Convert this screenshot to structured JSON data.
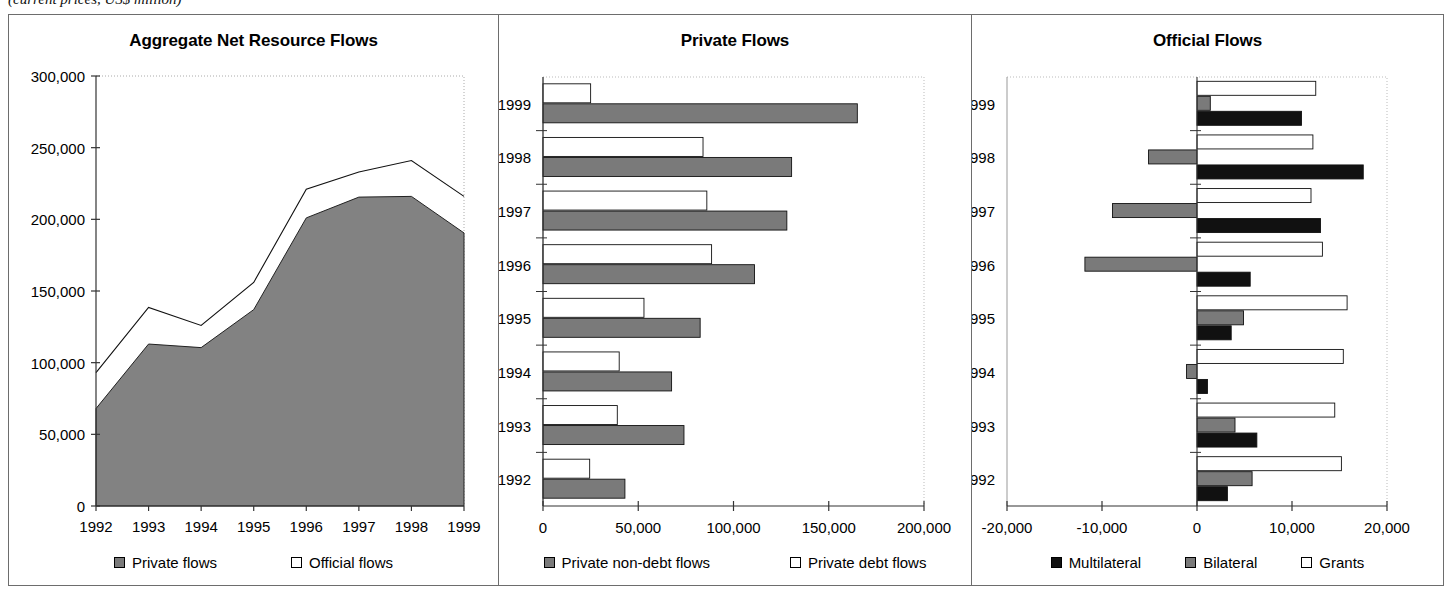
{
  "caption": "(current prices, US$ million)",
  "panels": [
    {
      "title": "Aggregate Net Resource Flows",
      "legend": [
        {
          "label": "Private flows",
          "swatch": "gray"
        },
        {
          "label": "Official flows",
          "swatch": "white"
        }
      ]
    },
    {
      "title": "Private Flows",
      "legend": [
        {
          "label": "Private non-debt flows",
          "swatch": "gray"
        },
        {
          "label": "Private debt flows",
          "swatch": "white"
        }
      ]
    },
    {
      "title": "Official Flows",
      "legend": [
        {
          "label": "Multilateral",
          "swatch": "black"
        },
        {
          "label": "Bilateral",
          "swatch": "gray"
        },
        {
          "label": "Grants",
          "swatch": "white"
        }
      ]
    }
  ],
  "chart_data": [
    {
      "type": "area",
      "title": "Aggregate Net Resource Flows",
      "xlabel": "",
      "ylabel": "",
      "categories": [
        "1992",
        "1993",
        "1994",
        "1995",
        "1996",
        "1997",
        "1998",
        "1999"
      ],
      "xticklabels": [
        "1992",
        "1993",
        "1994",
        "1995",
        "1996",
        "1997",
        "1998",
        "1999"
      ],
      "yticklabels": [
        "0",
        "50,000",
        "100,000",
        "150,000",
        "200,000",
        "250,000",
        "300,000"
      ],
      "ylim": [
        0,
        300000
      ],
      "ytick_step": 50000,
      "grid": false,
      "stacked": true,
      "series": [
        {
          "name": "Private flows",
          "color": "#7a7a7a",
          "values": [
            68000,
            113000,
            110500,
            137000,
            201000,
            215500,
            216000,
            190500
          ]
        },
        {
          "name": "Official flows",
          "color": "#ffffff",
          "values": [
            25000,
            25500,
            15500,
            19000,
            20000,
            17500,
            25000,
            25500
          ]
        }
      ],
      "total_line": [
        93000,
        138500,
        126000,
        156000,
        221000,
        233000,
        241000,
        216000
      ]
    },
    {
      "type": "bar",
      "orientation": "horizontal",
      "title": "Private Flows",
      "xlabel": "",
      "ylabel": "",
      "categories": [
        "1992",
        "1993",
        "1994",
        "1995",
        "1996",
        "1997",
        "1998",
        "1999"
      ],
      "xticklabels": [
        "0",
        "50,000",
        "100,000",
        "150,000",
        "200,000"
      ],
      "xlim": [
        0,
        200000
      ],
      "xtick_step": 50000,
      "grid": false,
      "series": [
        {
          "name": "Private non-debt flows",
          "color": "#7a7a7a",
          "values": [
            43000,
            74000,
            67500,
            82500,
            111000,
            128000,
            130500,
            165000
          ]
        },
        {
          "name": "Private debt flows",
          "color": "#ffffff",
          "values": [
            24500,
            39000,
            40000,
            53000,
            88500,
            86000,
            84000,
            25000
          ]
        }
      ]
    },
    {
      "type": "bar",
      "orientation": "horizontal",
      "title": "Official Flows",
      "xlabel": "",
      "ylabel": "",
      "categories": [
        "1992",
        "1993",
        "1994",
        "1995",
        "1996",
        "1997",
        "1998",
        "1999"
      ],
      "xticklabels": [
        "-20,000",
        "-10,000",
        "0",
        "10,000",
        "20,000"
      ],
      "xlim": [
        -20000,
        20000
      ],
      "xtick_step": 10000,
      "grid": false,
      "series": [
        {
          "name": "Multilateral",
          "color": "#111111",
          "values": [
            3200,
            6300,
            1100,
            3600,
            5600,
            13000,
            17500,
            11000
          ]
        },
        {
          "name": "Bilateral",
          "color": "#7a7a7a",
          "values": [
            5800,
            4000,
            -1100,
            4900,
            -11800,
            -8900,
            -5100,
            1400
          ]
        },
        {
          "name": "Grants",
          "color": "#ffffff",
          "values": [
            15200,
            14500,
            15400,
            15800,
            13200,
            12000,
            12200,
            12500
          ]
        }
      ]
    }
  ]
}
